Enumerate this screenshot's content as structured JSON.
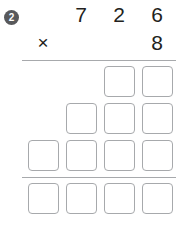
{
  "problem": {
    "number_label": "2",
    "multiplicand": [
      "7",
      "2",
      "6"
    ],
    "multiplier": [
      "8"
    ],
    "operator": "×"
  },
  "chart_data": {
    "type": "table",
    "expression": "726 × 8",
    "rows": [
      {
        "name": "multiplicand",
        "cells": [
          "",
          "7",
          "2",
          "6"
        ]
      },
      {
        "name": "multiplier",
        "cells": [
          "×",
          "",
          "",
          "8"
        ]
      },
      {
        "name": "partial-product-1",
        "cells": [
          "",
          "",
          "",
          ""
        ]
      },
      {
        "name": "partial-product-2",
        "cells": [
          "",
          "",
          "",
          ""
        ]
      },
      {
        "name": "partial-product-3",
        "cells": [
          "",
          "",
          "",
          ""
        ]
      },
      {
        "name": "final-answer",
        "cells": [
          "",
          "",
          "",
          ""
        ]
      }
    ],
    "box_counts": {
      "partial_product_1": 2,
      "partial_product_2": 3,
      "partial_product_3": 4,
      "final_answer": 4
    }
  },
  "colors": {
    "badge_bg": "#58595b",
    "badge_text": "#ffffff",
    "digit": "#231f20",
    "rule": "#a7a9ac",
    "box_border": "#a7a9ac",
    "page_bg": "#ffffff"
  }
}
